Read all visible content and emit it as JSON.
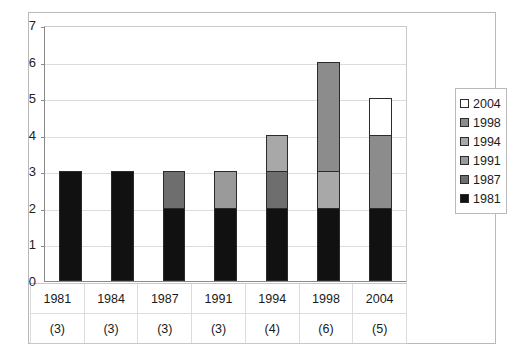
{
  "chart_data": {
    "type": "bar",
    "subtype": "stacked-vertical-bar",
    "title": "",
    "xlabel": "",
    "ylabel": "",
    "ylim": [
      0,
      7
    ],
    "ytick_step": 1,
    "yticks": [
      "7",
      "6",
      "5",
      "4",
      "3",
      "2",
      "1",
      "0"
    ],
    "grid": true,
    "legend_position": "right",
    "categories": [
      "1981",
      "1984",
      "1987",
      "1991",
      "1994",
      "1998",
      "2004"
    ],
    "category_counts": [
      "(3)",
      "(3)",
      "(3)",
      "(3)",
      "(4)",
      "(6)",
      "(5)"
    ],
    "totals": [
      3,
      3,
      3,
      3,
      4,
      6,
      5
    ],
    "series": [
      {
        "name": "1981",
        "color": "#111111",
        "values": [
          3,
          3,
          2,
          2,
          2,
          2,
          2
        ]
      },
      {
        "name": "1987",
        "color": "#6e6e6e",
        "values": [
          0,
          0,
          1,
          0,
          1,
          0,
          0
        ]
      },
      {
        "name": "1991",
        "color": "#9a9a9a",
        "values": [
          0,
          0,
          0,
          1,
          0,
          0,
          0
        ]
      },
      {
        "name": "1994",
        "color": "#a8a8a8",
        "values": [
          0,
          0,
          0,
          0,
          1,
          1,
          0
        ]
      },
      {
        "name": "1998",
        "color": "#8c8c8c",
        "values": [
          0,
          0,
          0,
          0,
          0,
          3,
          2
        ]
      },
      {
        "name": "2004",
        "color": "#ffffff",
        "values": [
          0,
          0,
          0,
          0,
          0,
          0,
          1
        ]
      }
    ],
    "stacks": [
      {
        "category": "1981",
        "count": "(3)",
        "segments": [
          {
            "series": "1981",
            "value": 3,
            "color": "#111111"
          }
        ]
      },
      {
        "category": "1984",
        "count": "(3)",
        "segments": [
          {
            "series": "1981",
            "value": 3,
            "color": "#111111"
          }
        ]
      },
      {
        "category": "1987",
        "count": "(3)",
        "segments": [
          {
            "series": "1981",
            "value": 2,
            "color": "#111111"
          },
          {
            "series": "1987",
            "value": 1,
            "color": "#6e6e6e"
          }
        ]
      },
      {
        "category": "1991",
        "count": "(3)",
        "segments": [
          {
            "series": "1981",
            "value": 2,
            "color": "#111111"
          },
          {
            "series": "1991",
            "value": 1,
            "color": "#9a9a9a"
          }
        ]
      },
      {
        "category": "1994",
        "count": "(4)",
        "segments": [
          {
            "series": "1981",
            "value": 2,
            "color": "#111111"
          },
          {
            "series": "1987",
            "value": 1,
            "color": "#6e6e6e"
          },
          {
            "series": "1994",
            "value": 1,
            "color": "#a8a8a8"
          }
        ]
      },
      {
        "category": "1998",
        "count": "(6)",
        "segments": [
          {
            "series": "1981",
            "value": 2,
            "color": "#111111"
          },
          {
            "series": "1994",
            "value": 1,
            "color": "#a8a8a8"
          },
          {
            "series": "1998",
            "value": 3,
            "color": "#8c8c8c"
          }
        ]
      },
      {
        "category": "2004",
        "count": "(5)",
        "segments": [
          {
            "series": "1981",
            "value": 2,
            "color": "#111111"
          },
          {
            "series": "1998",
            "value": 2,
            "color": "#8c8c8c"
          },
          {
            "series": "2004",
            "value": 1,
            "color": "#ffffff"
          }
        ]
      }
    ],
    "legend": [
      {
        "label": "2004",
        "color": "#ffffff"
      },
      {
        "label": "1998",
        "color": "#8c8c8c"
      },
      {
        "label": "1994",
        "color": "#a8a8a8"
      },
      {
        "label": "1991",
        "color": "#9a9a9a"
      },
      {
        "label": "1987",
        "color": "#6e6e6e"
      },
      {
        "label": "1981",
        "color": "#111111"
      }
    ]
  },
  "style": {
    "plot_background": "#ffffff",
    "grid_color": "#dcdcdc",
    "axis_color": "#8a8a8a",
    "border_color": "#b9b9b9",
    "segment_outline": "#2b2b2b"
  }
}
